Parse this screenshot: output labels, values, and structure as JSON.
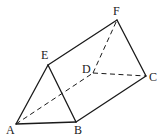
{
  "figure": {
    "type": "triangular-prism",
    "vertices": {
      "A": {
        "x": 16,
        "y": 124,
        "label": "A",
        "lx": 6,
        "ly": 134
      },
      "B": {
        "x": 76,
        "y": 122,
        "label": "B",
        "lx": 74,
        "ly": 134
      },
      "C": {
        "x": 146,
        "y": 76,
        "label": "C",
        "lx": 149,
        "ly": 81
      },
      "D": {
        "x": 93,
        "y": 73,
        "label": "D",
        "lx": 82,
        "ly": 73
      },
      "E": {
        "x": 48,
        "y": 65,
        "label": "E",
        "lx": 41,
        "ly": 59
      },
      "F": {
        "x": 117,
        "y": 20,
        "label": "F",
        "lx": 113,
        "ly": 15
      }
    },
    "solid_edges": [
      [
        "A",
        "B"
      ],
      [
        "A",
        "E"
      ],
      [
        "E",
        "B"
      ],
      [
        "E",
        "F"
      ],
      [
        "F",
        "C"
      ],
      [
        "B",
        "C"
      ]
    ],
    "dashed_edges": [
      [
        "A",
        "D"
      ],
      [
        "D",
        "F"
      ],
      [
        "D",
        "C"
      ]
    ]
  }
}
